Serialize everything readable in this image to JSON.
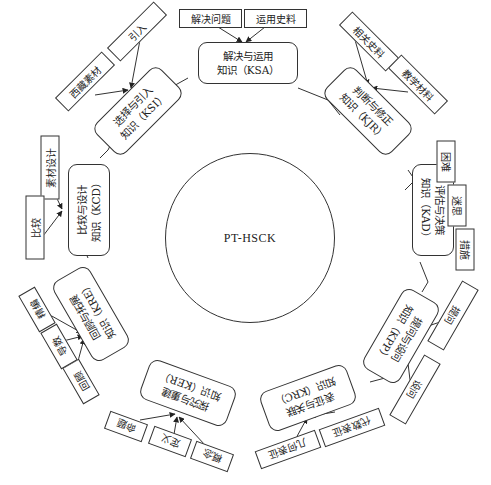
{
  "center": {
    "label": "PT-HSCK"
  },
  "nodes": [
    {
      "id": "KSA",
      "line1": "解决与运用",
      "line2": "知识（KSA）",
      "leaves": [
        "解决问题",
        "运用史料"
      ]
    },
    {
      "id": "KJR",
      "line1": "判断与修正",
      "line2": "知识（KJR）",
      "leaves": [
        "相关史料",
        "教学材料"
      ]
    },
    {
      "id": "KAD",
      "line1": "评估与决策",
      "line2": "知识（KAD）",
      "leaves": [
        "困难",
        "迷思",
        "措施"
      ]
    },
    {
      "id": "KPP",
      "line1": "提问与设问",
      "line2": "知识（KPP）",
      "leaves": [
        "提问",
        "设问"
      ]
    },
    {
      "id": "KRC",
      "line1": "表征与关联",
      "line2": "知识（KRC）",
      "leaves": [
        "代数表征",
        "几何表征"
      ]
    },
    {
      "id": "KER",
      "line1": "探究与重建",
      "line2": "知识（KER）",
      "leaves": [
        "概念",
        "定义",
        "命题"
      ]
    },
    {
      "id": "KRE",
      "line1": "回顾与拓展",
      "line2": "知识（KRE）",
      "leaves": [
        "回顾",
        "导数",
        "精编"
      ]
    },
    {
      "id": "KCD",
      "line1": "比较与设计",
      "line2": "知识（KCD）",
      "leaves": [
        "比较",
        "素材设计"
      ]
    },
    {
      "id": "KSI",
      "line1": "选择与引入",
      "line2": "知识（KSI）",
      "leaves": [
        "西藏素材",
        "引入"
      ]
    }
  ]
}
